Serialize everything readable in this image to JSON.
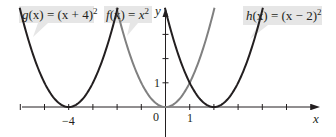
{
  "chart_data": {
    "type": "line",
    "title": "",
    "xlabel": "x",
    "ylabel": "y",
    "xlim": [
      -6.5,
      6.5
    ],
    "ylim": [
      -1.2,
      4.1
    ],
    "grid": false,
    "legend_position": "callout labels at top",
    "x_ticks": [
      -6,
      -5,
      -4,
      -3,
      -2,
      -1,
      0,
      1,
      2,
      3,
      4,
      5,
      6
    ],
    "x_tick_labels": [
      {
        "value": -4,
        "label": "−4"
      },
      {
        "value": 0,
        "label": "0"
      },
      {
        "value": 1,
        "label": "1"
      }
    ],
    "y_ticks": [
      1,
      2,
      3
    ],
    "y_tick_labels": [
      {
        "value": 1,
        "label": "1"
      }
    ],
    "series": [
      {
        "name": "g(x) = (x + 4)²",
        "expr": "(x+4)^2",
        "shift": -4,
        "color": "#231f20",
        "x": [
          -6,
          -5,
          -4,
          -3,
          -2
        ],
        "values": [
          4,
          1,
          0,
          1,
          4
        ]
      },
      {
        "name": "f(x) = x²",
        "expr": "x^2",
        "shift": 0,
        "color": "#808080",
        "x": [
          -2,
          -1,
          0,
          1,
          2
        ],
        "values": [
          4,
          1,
          0,
          1,
          4
        ]
      },
      {
        "name": "h(x) = (x − 2)²",
        "expr": "(x-2)^2",
        "shift": 2,
        "color": "#231f20",
        "x": [
          0,
          1,
          2,
          3,
          4
        ],
        "values": [
          4,
          1,
          0,
          1,
          4
        ]
      }
    ]
  },
  "labels": {
    "g": {
      "name": "g",
      "lhs": "(x)",
      "eq": " = ",
      "rhs": "(x + 4)",
      "exp": "2"
    },
    "f": {
      "name": "f",
      "lhs": "(x)",
      "eq": " = ",
      "rhs": "x",
      "exp": "2"
    },
    "h": {
      "name": "h",
      "lhs": "(x)",
      "eq": " = ",
      "rhs": "(x − 2)",
      "exp": "2"
    }
  },
  "axes": {
    "x_label": "x",
    "y_label": "y",
    "tick_neg4": "−4",
    "tick_0": "0",
    "tick_1x": "1",
    "tick_1y": "1"
  },
  "colors": {
    "dark_curve": "#231f20",
    "gray_curve": "#808080",
    "label_bg": "#e6e6e6",
    "axis": "#231f20"
  }
}
